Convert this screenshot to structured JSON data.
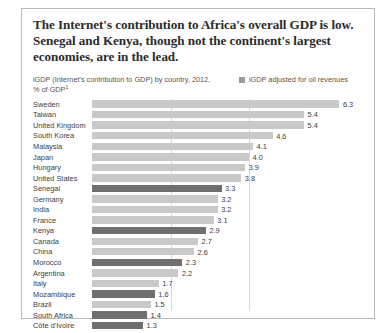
{
  "title": "The Internet's contribution to Africa's overall GDP is low. Senegal and Kenya, though not the continent's largest economies, are in the lead.",
  "subtitle": {
    "text": "iGDP (Internet's contribution to GDP) by country, 2012, % of GDP",
    "footnote_marker": "1"
  },
  "legend": {
    "swatch_color": "#9a9a9a",
    "label": "iGDP adjusted for oil revenues"
  },
  "colors": {
    "bar_default": "#c9c9c9",
    "bar_highlight": "#6f6f6f",
    "gridline": "#d8d8d8",
    "frame": "#b9b9b9",
    "title_text": "#2b2b2b",
    "body_text": "#3d3d3d"
  },
  "chart_data": {
    "type": "bar",
    "orientation": "horizontal",
    "title": "iGDP (Internet's contribution to GDP) by country, 2012, % of GDP",
    "xlabel": "",
    "ylabel": "",
    "xlim": [
      0,
      6.9
    ],
    "grid": true,
    "gridlines": [
      2.0,
      4.0
    ],
    "legend_position": "top-right",
    "categories": [
      "Sweden",
      "Taiwan",
      "United Kingdom",
      "South Korea",
      "Malaysia",
      "Japan",
      "Hungary",
      "United States",
      "Senegal",
      "Germany",
      "India",
      "France",
      "Kenya",
      "Canada",
      "China",
      "Morocco",
      "Argentina",
      "Italy",
      "Mozambique",
      "Brazil",
      "South Africa",
      "Côte d'Ivoire"
    ],
    "values": [
      6.3,
      5.4,
      5.4,
      4.6,
      4.1,
      4.0,
      3.9,
      3.8,
      3.3,
      3.2,
      3.2,
      3.1,
      2.9,
      2.7,
      2.6,
      2.3,
      2.2,
      1.7,
      1.6,
      1.5,
      1.4,
      1.3
    ],
    "value_labels": [
      "6.3",
      "5.4",
      "5.4",
      "4.6",
      "4.1",
      "4.0",
      "3.9",
      "3.8",
      "3.3",
      "3.2",
      "3.2",
      "3.1",
      "2.9",
      "2.7",
      "2.6",
      "2.3",
      "2.2",
      "1.7",
      "1.6",
      "1.5",
      "1.4",
      "1.3"
    ],
    "highlighted": [
      false,
      false,
      false,
      false,
      false,
      false,
      false,
      false,
      true,
      false,
      false,
      false,
      true,
      false,
      false,
      true,
      false,
      false,
      true,
      false,
      true,
      true
    ]
  }
}
